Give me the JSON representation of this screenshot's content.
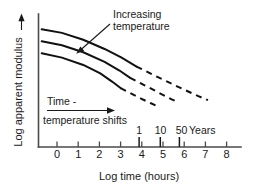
{
  "chart_data": {
    "type": "line",
    "title": "",
    "xlabel": "Log time (hours)",
    "ylabel": "Log apparent modulus",
    "xlim": [
      -0.9,
      8.6
    ],
    "ylim": [
      0,
      1
    ],
    "grid": false,
    "legend": null,
    "xticks": [
      "0",
      "1",
      "2",
      "3",
      "4",
      "5",
      "6",
      "7",
      "8"
    ],
    "xtick_values": [
      0,
      1,
      2,
      3,
      4,
      5,
      6,
      7,
      8
    ],
    "yticks": [],
    "secondary_axis": {
      "label": "Years",
      "ticks": [
        {
          "label": "1",
          "x": 3.87
        },
        {
          "label": "10",
          "x": 4.87
        },
        {
          "label": "50",
          "x": 5.77
        }
      ]
    },
    "annotations": [
      {
        "name": "increasing-temperature",
        "text_line1": "Increasing",
        "text_line2": "temperature"
      },
      {
        "name": "time-temperature-shifts",
        "text_line1": "Time -",
        "text_line2": "temperature shifts"
      }
    ],
    "series": [
      {
        "name": "curve-top",
        "solid_points": [
          [
            -0.75,
            0.885
          ],
          [
            0.2,
            0.858
          ],
          [
            1.2,
            0.806
          ],
          [
            2.2,
            0.737
          ],
          [
            3.0,
            0.672
          ],
          [
            3.7,
            0.605
          ]
        ],
        "dashed_points": [
          [
            3.7,
            0.605
          ],
          [
            4.6,
            0.533
          ],
          [
            5.6,
            0.456
          ],
          [
            6.6,
            0.382
          ],
          [
            7.05,
            0.352
          ]
        ]
      },
      {
        "name": "curve-middle",
        "solid_points": [
          [
            -0.75,
            0.795
          ],
          [
            0.2,
            0.765
          ],
          [
            1.2,
            0.712
          ],
          [
            2.2,
            0.64
          ],
          [
            2.9,
            0.575
          ],
          [
            3.4,
            0.52
          ]
        ],
        "dashed_points": [
          [
            3.4,
            0.52
          ],
          [
            4.1,
            0.462
          ],
          [
            4.75,
            0.408
          ],
          [
            5.35,
            0.358
          ],
          [
            5.65,
            0.336
          ]
        ]
      },
      {
        "name": "curve-bottom",
        "solid_points": [
          [
            -0.75,
            0.705
          ],
          [
            0.2,
            0.672
          ],
          [
            1.2,
            0.617
          ],
          [
            2.0,
            0.553
          ],
          [
            2.55,
            0.492
          ],
          [
            2.95,
            0.443
          ]
        ],
        "dashed_points": [
          [
            2.95,
            0.443
          ],
          [
            3.5,
            0.398
          ],
          [
            4.0,
            0.357
          ],
          [
            4.4,
            0.327
          ],
          [
            4.6,
            0.312
          ]
        ]
      }
    ]
  },
  "axis": {
    "x_title": "Log time (hours)",
    "y_title": "Log apparent modulus"
  },
  "ticks": {
    "x": [
      "0",
      "1",
      "2",
      "3",
      "4",
      "5",
      "6",
      "7",
      "8"
    ]
  },
  "years": {
    "one": "1",
    "ten": "10",
    "fifty": "50",
    "unit": "Years"
  },
  "annotations": {
    "increasing_line1": "Increasing",
    "increasing_line2": "temperature",
    "shift_line1": "Time -",
    "shift_line2": "temperature shifts"
  },
  "colors": {
    "curve": "#111111",
    "axis": "#4a4a4a",
    "text": "#1a1a1a",
    "background": "#ffffff"
  }
}
